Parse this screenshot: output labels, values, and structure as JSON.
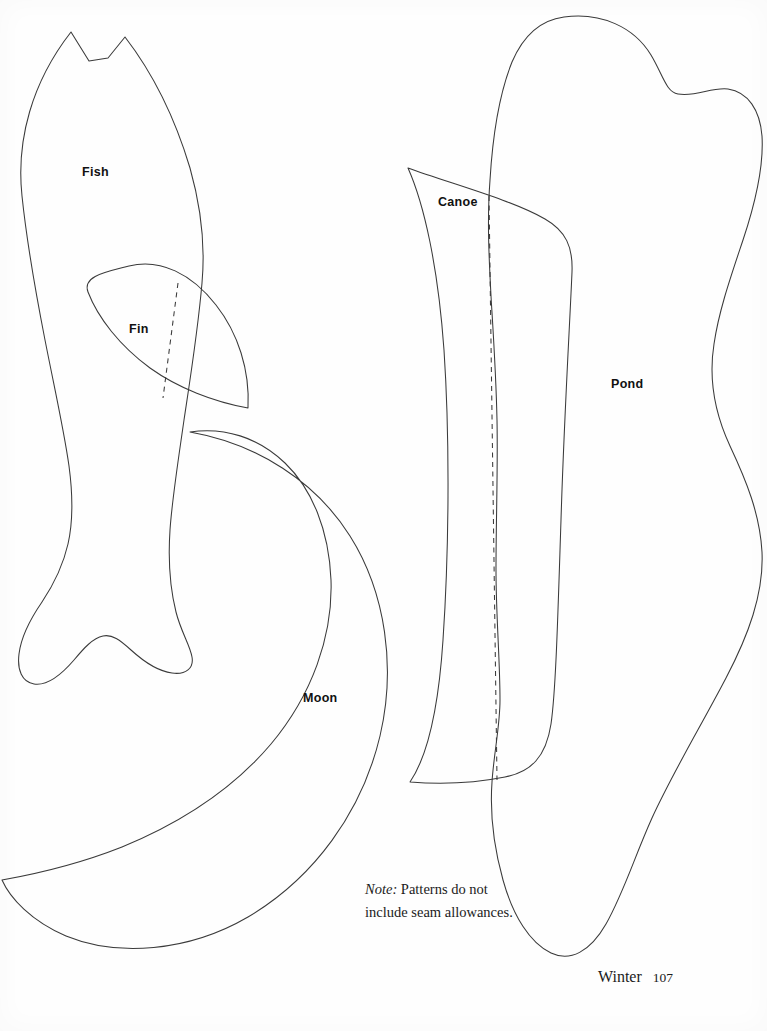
{
  "page": {
    "width": 767,
    "height": 1031,
    "background_color": "#fefefe",
    "ink_color": "#3a3a3a",
    "text_color": "#111111"
  },
  "labels": {
    "fish": "Fish",
    "fin": "Fin",
    "canoe": "Canoe",
    "pond": "Pond",
    "moon": "Moon"
  },
  "note": {
    "lead": "Note:",
    "line_1": " Patterns do not",
    "line_2": "include seam allowances."
  },
  "footer": {
    "section": "Winter",
    "page_number": "107"
  },
  "shapes": {
    "fish": {
      "name": "Fish",
      "label_position": {
        "x": 82,
        "y": 165
      },
      "outline": "M 71 32 L 89 61 L 108 58 L 125 37 C 152 72 175 118 190 168 C 203 214 205 250 202 283 C 198 330 190 380 184 420 C 178 462 172 500 170 530 C 168 560 170 588 176 612 C 181 632 190 645 192 657 C 194 668 186 675 172 673 C 156 671 142 660 131 650 C 120 640 112 634 103 636 C 93 638 84 648 74 660 C 62 674 47 686 34 684 C 22 682 17 670 19 654 C 21 637 31 618 42 602 C 54 584 63 566 68 544 C 73 522 73 496 69 466 C 64 430 54 386 45 340 C 36 294 27 244 22 196 C 16 140 32 82 71 32 Z"
    },
    "fin": {
      "name": "Fin",
      "label_position": {
        "x": 129,
        "y": 322
      },
      "outline": "M 129 266 C 160 258 192 274 216 305 C 238 333 250 370 248 408 C 214 402 178 388 150 368 C 120 346 98 318 88 292 C 82 276 106 272 129 266 Z",
      "fold_line": "M 178 283 L 163 398"
    },
    "moon": {
      "name": "Moon",
      "label_position": {
        "x": 303,
        "y": 691
      },
      "outline": "M 190 432 C 258 444 316 482 350 536 C 386 593 396 668 380 736 C 362 812 314 878 248 917 C 188 952 117 957 66 936 C 31 921 10 898 2 880 C 36 874 79 864 122 847 C 178 824 232 790 271 744 C 312 695 333 636 331 580 C 329 530 312 489 285 463 C 258 437 224 427 190 432 Z"
    },
    "canoe": {
      "name": "Canoe",
      "label_position": {
        "x": 438,
        "y": 195
      },
      "outline": "M 408 168 C 452 184 512 200 545 219 C 566 231 573 247 572 272 C 570 320 564 420 561 520 C 558 610 556 690 551 724 C 546 757 531 772 505 777 C 470 784 435 784 410 782 C 425 760 438 716 443 640 C 449 552 450 440 444 350 C 438 266 424 204 408 168 Z",
      "fold_line": "M 489 196 L 497 780"
    },
    "pond": {
      "name": "Pond",
      "label_position": {
        "x": 611,
        "y": 377
      },
      "outline": "M 564 17 C 601 12 634 27 651 55 C 663 75 666 92 678 94 C 697 97 711 87 728 89 C 748 92 760 110 762 136 C 764 168 755 204 743 240 C 731 276 719 310 714 344 C 708 382 716 416 730 446 C 746 480 760 514 762 552 C 764 594 748 636 726 678 C 702 724 672 774 652 818 C 634 858 624 892 606 924 C 590 952 570 962 551 953 C 530 943 513 916 503 880 C 493 844 490 810 492 782 C 494 752 500 726 500 700 C 500 660 496 616 496 570 C 496 520 498 468 497 420 C 496 372 493 330 491 296 C 489 258 487 220 490 180 C 493 130 500 92 512 62 C 524 34 541 20 564 17 Z"
    }
  }
}
